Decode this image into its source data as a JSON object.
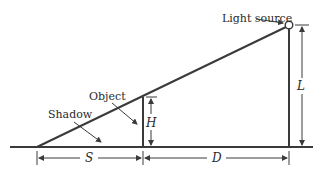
{
  "diagram": {
    "type": "similar-triangles shadow diagram",
    "labels": {
      "light_source": "Light source",
      "object": "Object",
      "shadow": "Shadow",
      "object_height": "H",
      "light_height": "L",
      "shadow_length": "S",
      "distance": "D"
    },
    "colors": {
      "line": "#3a3a3a",
      "text": "#2a2a2a",
      "background": "#ffffff"
    }
  }
}
